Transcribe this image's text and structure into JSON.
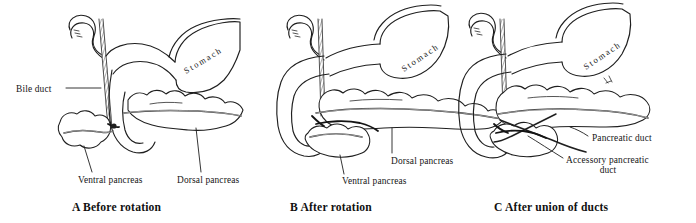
{
  "figure": {
    "background_color": "#ffffff",
    "ink_color": "#1f1f1f",
    "width": 696,
    "height": 223
  },
  "panels": [
    {
      "id": "A",
      "letter": "A",
      "caption": "Before rotation",
      "caption_full": "A   Before rotation",
      "organ_label": "Stomach",
      "labels": [
        {
          "name": "bile-duct",
          "text": "Bile duct"
        },
        {
          "name": "ventral-pancreas",
          "text": "Ventral pancreas"
        },
        {
          "name": "dorsal-pancreas",
          "text": "Dorsal pancreas"
        }
      ]
    },
    {
      "id": "B",
      "letter": "B",
      "caption": "After rotation",
      "caption_full": "B   After rotation",
      "organ_label": "Stomach",
      "labels": [
        {
          "name": "ventral-pancreas",
          "text": "Ventral pancreas"
        },
        {
          "name": "dorsal-pancreas",
          "text": "Dorsal pancreas"
        }
      ]
    },
    {
      "id": "C",
      "letter": "C",
      "caption": "After union of ducts",
      "caption_full": "C   After union of ducts",
      "organ_label": "Stomach",
      "labels": [
        {
          "name": "pancreatic-duct",
          "text": "Pancreatic duct"
        },
        {
          "name": "accessory-pancreatic-duct-line1",
          "text": "Accessory pancreatic"
        },
        {
          "name": "accessory-pancreatic-duct-line2",
          "text": "duct"
        }
      ]
    }
  ]
}
